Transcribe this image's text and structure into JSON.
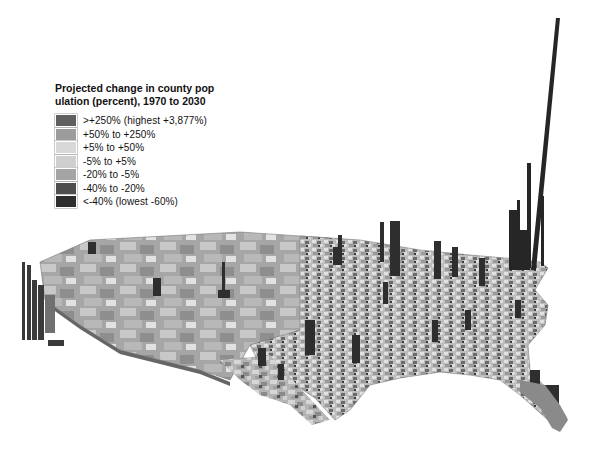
{
  "legend": {
    "title_line1": "Projected change in county pop",
    "title_line2": "ulation (percent), 1970 to 2030",
    "items": [
      {
        "label": ">+250% (highest +3,877%)",
        "color": "#5f5f5f"
      },
      {
        "label": "+50% to +250%",
        "color": "#9c9c9c"
      },
      {
        "label": "+5% to +50%",
        "color": "#d8d8d8"
      },
      {
        "label": "-5% to +5%",
        "color": "#cfcfcf"
      },
      {
        "label": "-20% to -5%",
        "color": "#a4a4a4"
      },
      {
        "label": "-40% to -20%",
        "color": "#4e4e4e"
      },
      {
        "label": "<-40% (lowest -60%)",
        "color": "#2e2e2e"
      }
    ]
  },
  "map": {
    "subject": "3D extruded map of contiguous United States counties",
    "extrusion_meaning": "Bar height proportional to projected population change",
    "tallest_spike_region": "Northeast (Atlantic coast)"
  }
}
